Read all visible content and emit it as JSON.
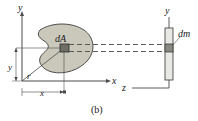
{
  "figure": {
    "caption": "(b)",
    "labels": {
      "y_axis_left": "y",
      "x_axis_left": "x",
      "y_axis_right": "y",
      "z_axis": "z",
      "area_element": "dA",
      "mass_element": "dm",
      "radius": "r",
      "vertical_distance": "y",
      "horizontal_distance": "x"
    },
    "colors": {
      "lamina_fill": "#c9c8ba",
      "lamina_stroke": "#3d3d3d",
      "element_fill": "#6e6e64",
      "element_stroke": "#2b2b2b",
      "rod_fill": "#e8e8e4",
      "rod_stroke": "#4a4a4a",
      "rod_element_fill": "#8a8a80",
      "axis_stroke": "#4a4a4a",
      "dashed_stroke": "#4a4a4a",
      "text": "#1a1a1a",
      "background": "#ffffff"
    }
  }
}
